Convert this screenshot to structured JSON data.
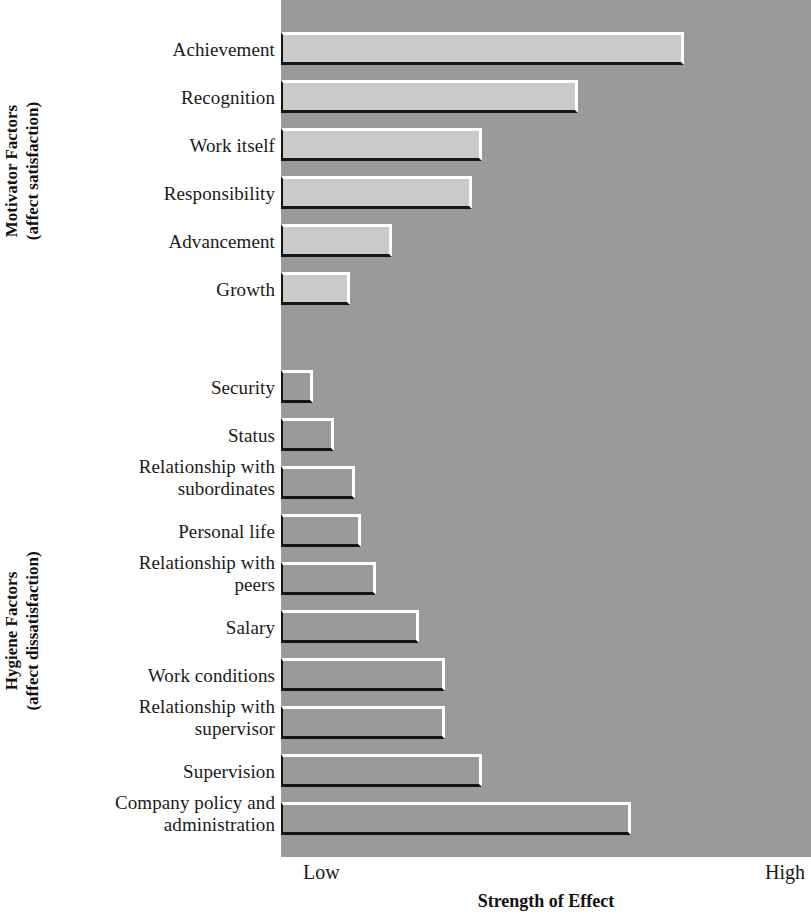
{
  "chart_data": {
    "type": "bar",
    "orientation": "horizontal",
    "title": "",
    "xlabel": "Strength of Effect",
    "ylabel": "",
    "xtick_labels": [
      "Low",
      "High"
    ],
    "xlim": [
      0,
      100
    ],
    "grid": false,
    "legend": null,
    "groups": [
      {
        "name": "Motivator Factors",
        "subtitle": "(affect satisfaction)",
        "categories": [
          "Achievement",
          "Recognition",
          "Work itself",
          "Responsibility",
          "Advancement",
          "Growth"
        ],
        "values": [
          76,
          56,
          38,
          36,
          21,
          13
        ]
      },
      {
        "name": "Hygiene Factors",
        "subtitle": "(affect dissatisfaction)",
        "categories": [
          "Security",
          "Status",
          "Relationship with subordinates",
          "Personal life",
          "Relationship with peers",
          "Salary",
          "Work conditions",
          "Relationship with supervisor",
          "Supervision",
          "Company policy and administration"
        ],
        "values": [
          6,
          10,
          14,
          15,
          18,
          26,
          31,
          31,
          38,
          66
        ]
      }
    ],
    "categories": [
      "Achievement",
      "Recognition",
      "Work itself",
      "Responsibility",
      "Advancement",
      "Growth",
      "Security",
      "Status",
      "Relationship with subordinates",
      "Personal life",
      "Relationship with peers",
      "Salary",
      "Work conditions",
      "Relationship with supervisor",
      "Supervision",
      "Company policy and administration"
    ],
    "values": [
      76,
      56,
      38,
      36,
      21,
      13,
      6,
      10,
      14,
      15,
      18,
      26,
      31,
      31,
      38,
      66
    ]
  },
  "axis": {
    "low_label": "Low",
    "high_label": "High",
    "title": "Strength of Effect"
  },
  "motivator_group": {
    "title": "Motivator Factors",
    "subtitle": "(affect satisfaction)",
    "bars": [
      {
        "label": "Achievement",
        "label_line2": "",
        "value": 76
      },
      {
        "label": "Recognition",
        "label_line2": "",
        "value": 56
      },
      {
        "label": "Work itself",
        "label_line2": "",
        "value": 38
      },
      {
        "label": "Responsibility",
        "label_line2": "",
        "value": 36
      },
      {
        "label": "Advancement",
        "label_line2": "",
        "value": 21
      },
      {
        "label": "Growth",
        "label_line2": "",
        "value": 13
      }
    ]
  },
  "hygiene_group": {
    "title": "Hygiene Factors",
    "subtitle": "(affect dissatisfaction)",
    "bars": [
      {
        "label": "Security",
        "label_line2": "",
        "value": 6
      },
      {
        "label": "Status",
        "label_line2": "",
        "value": 10
      },
      {
        "label": "Relationship with",
        "label_line2": "subordinates",
        "value": 14
      },
      {
        "label": "Personal life",
        "label_line2": "",
        "value": 15
      },
      {
        "label": "Relationship with",
        "label_line2": "peers",
        "value": 18
      },
      {
        "label": "Salary",
        "label_line2": "",
        "value": 26
      },
      {
        "label": "Work conditions",
        "label_line2": "",
        "value": 31
      },
      {
        "label": "Relationship with",
        "label_line2": "supervisor",
        "value": 31
      },
      {
        "label": "Supervision",
        "label_line2": "",
        "value": 38
      },
      {
        "label": "Company policy and",
        "label_line2": "administration",
        "value": 66
      }
    ]
  },
  "colors": {
    "plot_background": "#9a9a9a",
    "motivator_bar_fill": "#c9c9c9",
    "hygiene_bar_fill": "#9a9a9a",
    "bar_highlight": "#ffffff",
    "bar_shadow": "#141414",
    "text": "#1a1a1a"
  },
  "layout": {
    "plot_left_px": 281,
    "plot_right_px": 811,
    "plot_top_px": 0,
    "plot_bottom_px": 857,
    "row_pitch_px": 48,
    "bar_height_px": 33,
    "motivator_first_row_top_px": 25,
    "hygiene_first_row_top_px": 363,
    "value_scale_px_per_unit": 5.3
  }
}
